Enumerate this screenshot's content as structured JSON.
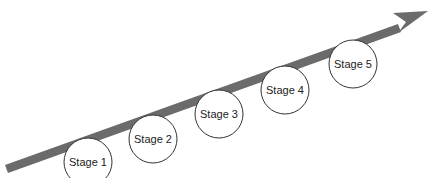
{
  "diagram": {
    "type": "stage-progression-arrow",
    "arrow_color": "#6b6b6b",
    "circle_fill": "#ffffff",
    "circle_stroke": "#333333",
    "stages": [
      {
        "label": "Stage 1",
        "cx": 88,
        "cy": 162
      },
      {
        "label": "Stage 2",
        "cx": 153,
        "cy": 139
      },
      {
        "label": "Stage 3",
        "cx": 219,
        "cy": 114
      },
      {
        "label": "Stage 4",
        "cx": 285,
        "cy": 90
      },
      {
        "label": "Stage 5",
        "cx": 353,
        "cy": 64
      }
    ]
  }
}
